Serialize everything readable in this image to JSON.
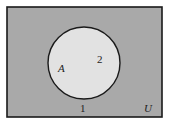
{
  "diagram": {
    "type": "venn",
    "universe_label": "U",
    "set_label": "A",
    "regions": [
      {
        "id": "1",
        "label": "1",
        "description": "outside A"
      },
      {
        "id": "2",
        "label": "2",
        "description": "inside A"
      }
    ],
    "colors": {
      "universe_fill": "#a9a9a9",
      "set_fill": "#e2e2e2",
      "stroke": "#1a1a1a"
    }
  }
}
